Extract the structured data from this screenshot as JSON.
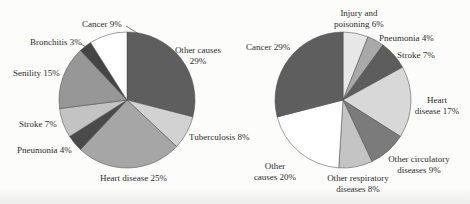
{
  "page": {
    "background": "#fcfcfa"
  },
  "chart_data": [
    {
      "type": "pie",
      "position": "left",
      "title": "",
      "start_at": "12-oclock",
      "direction": "clockwise",
      "slices": [
        {
          "label": "Other causes",
          "value": 29,
          "color": "#5e5e5e"
        },
        {
          "label": "Tuberculosis",
          "value": 8,
          "color": "#d2d2d2"
        },
        {
          "label": "Heart disease",
          "value": 25,
          "color": "#a6a6a6"
        },
        {
          "label": "Pneumonia",
          "value": 4,
          "color": "#4a4a4a"
        },
        {
          "label": "Stroke",
          "value": 7,
          "color": "#c3c3c3"
        },
        {
          "label": "Senility",
          "value": 15,
          "color": "#979797"
        },
        {
          "label": "Bronchitis",
          "value": 3,
          "color": "#454545"
        },
        {
          "label": "Cancer",
          "value": 9,
          "color": "#ffffff"
        }
      ],
      "labels": {
        "cancer": "Cancer 9%",
        "bronchitis": "Bronchitis 3%",
        "senility": "Senility 15%",
        "stroke": "Stroke 7%",
        "pneumonia": "Pneumonia 4%",
        "heart": "Heart disease 25%",
        "tuberculosis": "Tuberculosis 8%",
        "other_causes": "Other causes\n29%"
      }
    },
    {
      "type": "pie",
      "position": "right",
      "title": "",
      "start_at": "12-oclock",
      "direction": "clockwise",
      "slices": [
        {
          "label": "Injury and poisoning",
          "value": 6,
          "color": "#e7e7e7"
        },
        {
          "label": "Pneumonia",
          "value": 4,
          "color": "#a9a9a9"
        },
        {
          "label": "Stroke",
          "value": 7,
          "color": "#5d5d5d"
        },
        {
          "label": "Heart disease",
          "value": 17,
          "color": "#d8d8d8"
        },
        {
          "label": "Other circulatory diseases",
          "value": 9,
          "color": "#7b7b7b"
        },
        {
          "label": "Other respiratory diseases",
          "value": 8,
          "color": "#c4c4c4"
        },
        {
          "label": "Other causes",
          "value": 20,
          "color": "#ffffff"
        },
        {
          "label": "Cancer",
          "value": 29,
          "color": "#5e5e5e"
        }
      ],
      "labels": {
        "injury": "Injury and\npoisoning 6%",
        "pneumonia": "Pneumonia 4%",
        "stroke": "Stroke 7%",
        "heart": "Heart\ndisease 17%",
        "circulatory": "Other circulatory\ndiseases 9%",
        "respiratory": "Other respiratory\ndiseases 8%",
        "other_causes": "Other\ncauses 20%",
        "cancer": "Cancer 29%"
      }
    }
  ]
}
